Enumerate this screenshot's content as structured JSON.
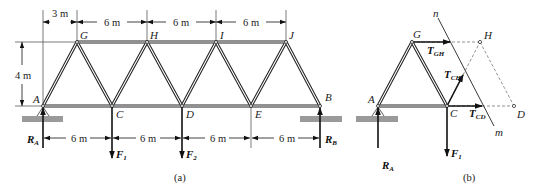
{
  "figure": {
    "part_a": {
      "caption": "(a)",
      "nodes": {
        "A": "A",
        "B": "B",
        "C": "C",
        "D": "D",
        "E": "E",
        "G": "G",
        "H": "H",
        "I": "I",
        "J": "J"
      },
      "top_dimensions": [
        "3 m",
        "6 m",
        "6 m",
        "6 m"
      ],
      "height_dimension": "4 m",
      "bottom_dimensions": [
        "6 m",
        "6 m",
        "6 m",
        "6 m"
      ],
      "reactions": {
        "RA": "R",
        "RA_sub": "A",
        "RB": "R",
        "RB_sub": "B"
      },
      "loads": {
        "F1": "F",
        "F1_sub": "1",
        "F2": "F",
        "F2_sub": "2"
      }
    },
    "part_b": {
      "caption": "(b)",
      "nodes": {
        "A": "A",
        "G": "G",
        "H": "H",
        "C": "C",
        "D": "D"
      },
      "cut_labels": {
        "top": "n",
        "bottom": "m"
      },
      "forces": {
        "TGH": "T",
        "TGH_sub": "GH",
        "TCH": "T",
        "TCH_sub": "CH",
        "TCD": "T",
        "TCD_sub": "CD",
        "RA": "R",
        "RA_sub": "A",
        "F1": "F",
        "F1_sub": "1"
      }
    }
  }
}
